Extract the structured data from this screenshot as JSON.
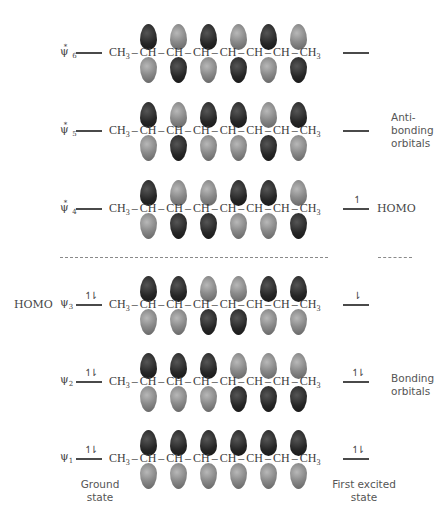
{
  "chain_text": {
    "start": "CH",
    "start_sub": "3",
    "ch": "CH",
    "bond": "–",
    "end": "CH",
    "end_sub": "3"
  },
  "orbitals": [
    {
      "id": "psi6",
      "symbol": "ψ",
      "index": "6",
      "star": "*",
      "y": 53,
      "top": [
        "dark",
        "light",
        "dark",
        "light",
        "dark",
        "light"
      ],
      "bottom": [
        "light",
        "dark",
        "light",
        "dark",
        "light",
        "dark"
      ],
      "ground_electrons": "",
      "excited_electrons": ""
    },
    {
      "id": "psi5",
      "symbol": "ψ",
      "index": "5",
      "star": "*",
      "y": 131,
      "top": [
        "dark",
        "light",
        "dark",
        "dark",
        "light",
        "dark"
      ],
      "bottom": [
        "light",
        "dark",
        "light",
        "light",
        "dark",
        "light"
      ],
      "ground_electrons": "",
      "excited_electrons": ""
    },
    {
      "id": "psi4",
      "symbol": "ψ",
      "index": "4",
      "star": "*",
      "y": 209,
      "top": [
        "dark",
        "light",
        "light",
        "dark",
        "dark",
        "light"
      ],
      "bottom": [
        "light",
        "dark",
        "dark",
        "light",
        "light",
        "dark"
      ],
      "ground_electrons": "",
      "excited_electrons": "↿"
    },
    {
      "id": "psi3",
      "symbol": "ψ",
      "index": "3",
      "star": "",
      "y": 305,
      "top": [
        "dark",
        "dark",
        "light",
        "light",
        "dark",
        "dark"
      ],
      "bottom": [
        "light",
        "light",
        "dark",
        "dark",
        "light",
        "light"
      ],
      "ground_electrons": "↿⇂",
      "excited_electrons": "⇂"
    },
    {
      "id": "psi2",
      "symbol": "ψ",
      "index": "2",
      "star": "",
      "y": 382,
      "top": [
        "dark",
        "dark",
        "dark",
        "light",
        "light",
        "light"
      ],
      "bottom": [
        "light",
        "light",
        "light",
        "dark",
        "dark",
        "dark"
      ],
      "ground_electrons": "↿⇂",
      "excited_electrons": "↿⇂"
    },
    {
      "id": "psi1",
      "symbol": "ψ",
      "index": "1",
      "star": "",
      "y": 459,
      "top": [
        "dark",
        "dark",
        "dark",
        "dark",
        "dark",
        "dark"
      ],
      "bottom": [
        "light",
        "light",
        "light",
        "light",
        "light",
        "light"
      ],
      "ground_electrons": "↿⇂",
      "excited_electrons": "↿⇂"
    }
  ],
  "labels": {
    "antibonding": [
      "Anti-",
      "bonding",
      "orbitals"
    ],
    "bonding": [
      "Bonding",
      "orbitals"
    ],
    "homo_ground": "HOMO",
    "homo_excited": "HOMO",
    "ground_state": [
      "Ground",
      "state"
    ],
    "first_excited_state": [
      "First excited",
      "state"
    ]
  },
  "colors": {
    "dark_lobe": "#222222",
    "light_lobe": "#8a8a8a",
    "level_line": "#4a4a4a",
    "dashed_divider": "#8a8a8a"
  }
}
